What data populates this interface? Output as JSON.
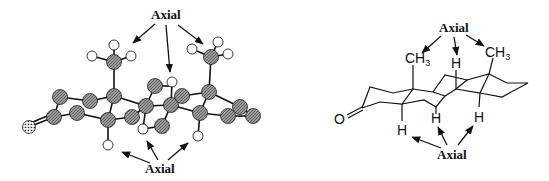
{
  "figure": {
    "left_model": {
      "type": "ball-and-stick",
      "top_label": "Axial",
      "bottom_label": "Axial"
    },
    "right_model": {
      "type": "skeletal-formula",
      "top_label": "Axial",
      "bottom_label": "Axial",
      "atoms": {
        "oxygen": "O",
        "methyl_1": "CH",
        "methyl_1_sub": "3",
        "methyl_2": "CH",
        "methyl_2_sub": "3",
        "h_top": "H",
        "h_bottom_1": "H",
        "h_bottom_2": "H",
        "h_bottom_3": "H"
      }
    },
    "colors": {
      "carbon": "#8a8a8a",
      "hydrogen": "#ffffff",
      "oxygen": "#d8d8d8",
      "stroke": "#111111"
    }
  }
}
